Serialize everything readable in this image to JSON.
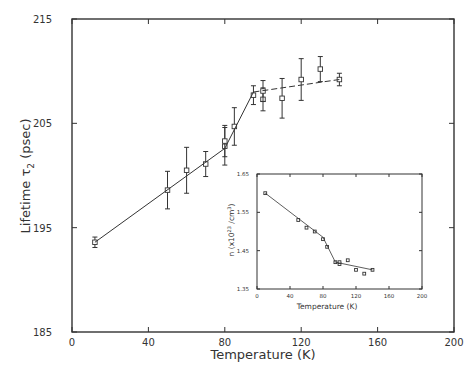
{
  "chart_data": [
    {
      "type": "scatter",
      "title": "",
      "xlabel": "Temperature (K)",
      "ylabel": "Lifetime τ2 (psec)",
      "xlim": [
        0,
        200
      ],
      "ylim": [
        185,
        215
      ],
      "xticks": [
        0,
        40,
        80,
        120,
        160,
        200
      ],
      "yticks": [
        185,
        195,
        205,
        215
      ],
      "grid": false,
      "legend": null,
      "series": [
        {
          "name": "Lifetime τ2 (measured, with error bars)",
          "marker": "open-square",
          "x": [
            12,
            50,
            60,
            70,
            80,
            80,
            85,
            95,
            100,
            100,
            110,
            120,
            130,
            140
          ],
          "y": [
            193.6,
            198.6,
            200.5,
            201.1,
            202.8,
            203.3,
            204.7,
            207.7,
            207.3,
            208.1,
            207.4,
            209.2,
            210.2,
            209.2
          ],
          "yerr": [
            0.5,
            1.8,
            2.2,
            1.2,
            1.8,
            1.5,
            1.8,
            0.9,
            1.1,
            1.0,
            1.9,
            2.0,
            1.2,
            0.6
          ]
        },
        {
          "name": "Fit line (solid)",
          "style": "solid",
          "x": [
            12,
            80,
            95
          ],
          "y": [
            193.6,
            202.6,
            208.0
          ]
        },
        {
          "name": "Fit line (dashed)",
          "style": "dashed",
          "x": [
            95,
            140
          ],
          "y": [
            208.0,
            209.2
          ]
        }
      ]
    },
    {
      "type": "scatter",
      "inset": true,
      "title": "",
      "xlabel": "Temperature (K)",
      "ylabel": "n (x10^23 /cm^3)",
      "xlim": [
        0,
        200
      ],
      "ylim": [
        1.35,
        1.65
      ],
      "xticks": [
        0,
        40,
        80,
        120,
        160,
        200
      ],
      "yticks": [
        1.35,
        1.45,
        1.55,
        1.65
      ],
      "grid": false,
      "legend": null,
      "series": [
        {
          "name": "Density n (measured)",
          "marker": "open-square",
          "x": [
            10,
            50,
            60,
            70,
            80,
            85,
            95,
            100,
            100,
            110,
            120,
            130,
            140
          ],
          "y": [
            1.6,
            1.53,
            1.51,
            1.5,
            1.48,
            1.46,
            1.42,
            1.415,
            1.42,
            1.425,
            1.4,
            1.39,
            1.4
          ]
        },
        {
          "name": "Fit line",
          "style": "solid",
          "x": [
            10,
            80,
            95,
            140
          ],
          "y": [
            1.6,
            1.485,
            1.42,
            1.4
          ]
        }
      ]
    }
  ],
  "labels": {
    "main_ylabel_prefix": "Lifetime τ",
    "main_ylabel_sub": "2",
    "main_ylabel_suffix": " (psec)",
    "main_xlabel": "Temperature (K)",
    "inset_xlabel": "Temperature (K)",
    "inset_ylabel": "n (x10",
    "inset_ylabel_sup1": "23",
    "inset_ylabel_mid": " /cm",
    "inset_ylabel_sup2": "3",
    "inset_ylabel_end": ")"
  },
  "tick_labels": {
    "main_x": [
      "0",
      "40",
      "80",
      "120",
      "160",
      "200"
    ],
    "main_y": [
      "185",
      "195",
      "205",
      "215"
    ],
    "inset_x": [
      "0",
      "40",
      "80",
      "120",
      "160",
      "200"
    ],
    "inset_y": [
      "1.35",
      "1.45",
      "1.55",
      "1.65"
    ]
  },
  "colors": {
    "ink": "#333333",
    "background": "#ffffff"
  }
}
